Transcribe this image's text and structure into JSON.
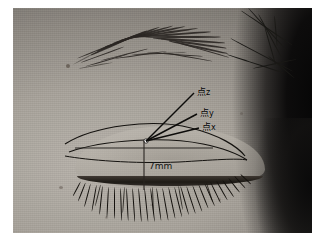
{
  "figure": {
    "type": "clinical-photograph",
    "annotations": {
      "point_z": {
        "kanji": "点",
        "subscript": "z",
        "full_label": "点z"
      },
      "point_y": {
        "kanji": "点",
        "subscript": "y",
        "full_label": "点y"
      },
      "point_x": {
        "kanji": "点",
        "subscript": "x",
        "full_label": "点x"
      },
      "measurement": "7mm"
    },
    "colors": {
      "annotation_line": "#111111",
      "annotation_text": "#000000",
      "skin_light": "#b9b4ac",
      "skin_mid": "#a8a39b",
      "skin_shadow": "#6e6a64",
      "hair_dark": "#0a0a0a",
      "lash_dark": "#14110d",
      "page_background": "#ffffff"
    }
  }
}
